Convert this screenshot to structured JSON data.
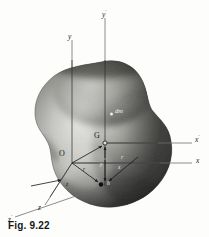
{
  "figure": {
    "caption": "Fig. 9.22",
    "page_bleed_text": "",
    "background_color": "#fdfdfc",
    "ink_color": "#1b1c1f"
  },
  "body_shape": {
    "name": "rigid-body-blob",
    "description": "irregular peanut shaped solid, grayscale airbrush shading",
    "fill_light": "#ececea",
    "fill_mid": "#9a9a96",
    "fill_dark": "#1d1d1d",
    "highlight_color": "#f3f3f0",
    "outline_color": "#2a2a2a"
  },
  "axes": [
    {
      "id": "y",
      "label": "y",
      "prime": "",
      "system": "O",
      "orientation": "vertical",
      "label_x": 69,
      "label_y": 34,
      "line": {
        "x1": 72,
        "y1": 40,
        "x2": 72,
        "y2": 163
      }
    },
    {
      "id": "y-prime",
      "label": "y",
      "prime": "′",
      "system": "G",
      "orientation": "vertical",
      "label_x": 104,
      "label_y": 12,
      "line": {
        "x1": 105,
        "y1": 18,
        "x2": 105,
        "y2": 186
      }
    },
    {
      "id": "x",
      "label": "x",
      "prime": "",
      "system": "O",
      "orientation": "horizontal",
      "label_x": 196,
      "label_y": 159,
      "line": {
        "x1": 72,
        "y1": 163,
        "x2": 193,
        "y2": 163
      }
    },
    {
      "id": "x-prime",
      "label": "x",
      "prime": "′",
      "system": "G",
      "orientation": "horizontal",
      "label_x": 196,
      "label_y": 138,
      "line": {
        "x1": 105,
        "y1": 143,
        "x2": 193,
        "y2": 143
      }
    },
    {
      "id": "z",
      "label": "z",
      "prime": "",
      "system": "O",
      "orientation": "oblique-down-left",
      "label_x": 40,
      "label_y": 208,
      "line": {
        "x1": 72,
        "y1": 163,
        "x2": 44,
        "y2": 206
      }
    },
    {
      "id": "z-prime",
      "label": "z",
      "prime": "′",
      "system": "G",
      "orientation": "oblique-down-left",
      "label_x": 10,
      "label_y": 220,
      "line": {
        "x1": 105,
        "y1": 186,
        "x2": 14,
        "y2": 218
      }
    }
  ],
  "points": [
    {
      "id": "origin-O",
      "label": "O",
      "label_x": 61,
      "label_y": 152,
      "marker_x": 72,
      "marker_y": 163,
      "marker": "none"
    },
    {
      "id": "centroid-G",
      "label": "G",
      "label_x": 95,
      "label_y": 134,
      "marker_x": 105,
      "marker_y": 143,
      "marker": "open-circle"
    },
    {
      "id": "mass-element-dm",
      "label": "dm",
      "label_x": 116,
      "label_y": 110,
      "marker_x": 112,
      "marker_y": 114,
      "marker": "dot"
    },
    {
      "id": "element-point-P",
      "label": "",
      "label_x": 0,
      "label_y": 0,
      "marker_x": 101,
      "marker_y": 185,
      "marker": "filled-dot"
    }
  ],
  "vectors": [
    {
      "id": "vector-r",
      "label": "r",
      "from": "O",
      "to": "element",
      "label_x": 84,
      "label_y": 172,
      "x1": 72,
      "y1": 163,
      "x2": 99,
      "y2": 183
    },
    {
      "id": "vector-r-bar",
      "label": "r̄",
      "from": "O",
      "to": "G",
      "label_x": 90,
      "label_y": 151,
      "x1": 72,
      "y1": 163,
      "x2": 103,
      "y2": 145
    },
    {
      "id": "vector-y-component",
      "label": "y",
      "from": "axis",
      "to": "element",
      "label_x": 100,
      "label_y": 167,
      "x1": 105,
      "y1": 155,
      "x2": 105,
      "y2": 182
    },
    {
      "id": "vector-y-prime-component",
      "label": "y",
      "from": "G",
      "to": "axis",
      "label_x": 98,
      "label_y": 152,
      "x1": 105,
      "y1": 158,
      "x2": 105,
      "y2": 146
    },
    {
      "id": "vector-r-prime",
      "label": "r",
      "from": "G",
      "to": "element",
      "label_x": 120,
      "label_y": 160,
      "x1": 137,
      "y1": 158,
      "x2": 108,
      "y2": 182
    },
    {
      "id": "vector-x-label",
      "label": "x",
      "label_x": 117,
      "label_y": 168,
      "x1": 0,
      "y1": 0,
      "x2": 0,
      "y2": 0
    },
    {
      "id": "vector-z-tick",
      "label": "z",
      "label_x": 66,
      "label_y": 186,
      "x1": 0,
      "y1": 0,
      "x2": 0,
      "y2": 0
    },
    {
      "id": "vector-arrow-to-body-upper",
      "label": "",
      "x1": 30,
      "y1": 184,
      "x2": 62,
      "y2": 180
    }
  ],
  "small_labels": [
    {
      "id": "label-r-near-O",
      "text": "r",
      "x": 84,
      "y": 171
    },
    {
      "id": "label-y-lower",
      "text": "y",
      "x": 100,
      "y": 166
    },
    {
      "id": "label-x-right",
      "text": "x",
      "x": 118,
      "y": 169
    },
    {
      "id": "label-rprime",
      "text": "r",
      "x": 121,
      "y": 159
    },
    {
      "id": "label-z-mid",
      "text": "z",
      "x": 67,
      "y": 187
    },
    {
      "id": "label-h",
      "text": "h",
      "x": 108,
      "y": 186
    }
  ]
}
